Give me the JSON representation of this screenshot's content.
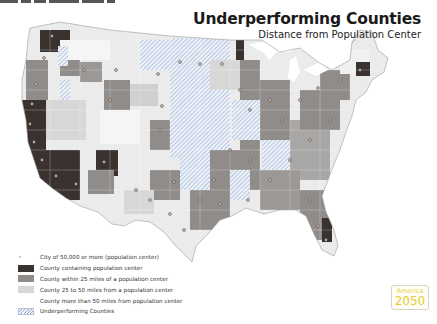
{
  "header_strip": {
    "segments": [
      18,
      10,
      12,
      30,
      8,
      14
    ]
  },
  "title": {
    "main": "Underperforming Counties",
    "subtitle": "Distance from Population Center"
  },
  "colors": {
    "population_center_county": "#3b3330",
    "within_25_miles": "#8f8c8a",
    "between_25_50_miles": "#d6d6d6",
    "beyond_50_miles": "#f6f6f6",
    "underperforming_hatch": "#8fa6cc",
    "city_dot": "#e8dcd2",
    "logo_text": "#e6cc2e"
  },
  "legend": {
    "items": [
      {
        "type": "dot",
        "label": "City of 50,000 or more (population center)"
      },
      {
        "type": "swatch",
        "color": "#3b3330",
        "label": "County containing population center"
      },
      {
        "type": "swatch",
        "color": "#8f8c8a",
        "label": "County within 25 miles of a population center"
      },
      {
        "type": "swatch",
        "color": "#d8d8d8",
        "label": "County 25 to 50 miles from a population center"
      },
      {
        "type": "swatch",
        "color": "#ffffff",
        "label": "County more than 50 miles from population center"
      },
      {
        "type": "hatch",
        "label": "Underperforming Counties"
      }
    ]
  },
  "logo": {
    "line1": "America",
    "line2": "2050"
  }
}
